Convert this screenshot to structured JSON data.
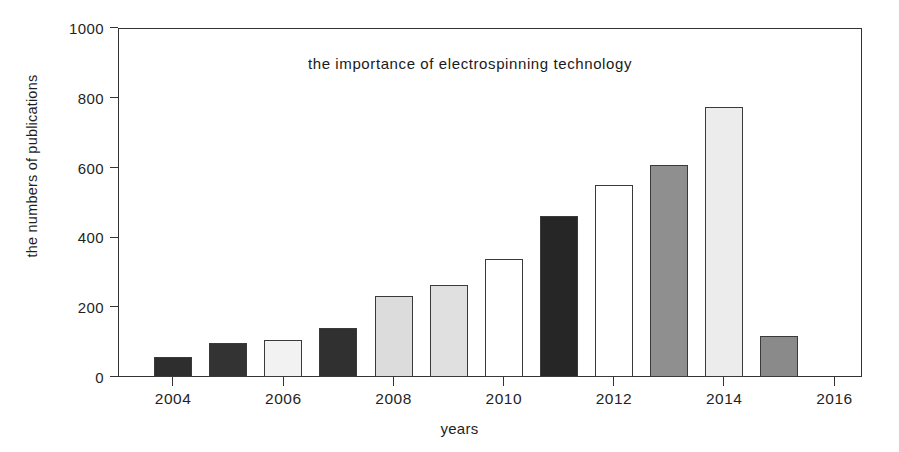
{
  "chart_data": {
    "type": "bar",
    "title": "the importance of electrospinning technology",
    "xlabel": "years",
    "ylabel": "the numbers of publications",
    "categories": [
      2004,
      2005,
      2006,
      2007,
      2008,
      2009,
      2010,
      2011,
      2012,
      2013,
      2014,
      2015
    ],
    "values": [
      58,
      98,
      105,
      140,
      232,
      265,
      337,
      462,
      550,
      608,
      775,
      118
    ],
    "bar_fills": [
      "#2e2e2e",
      "#333333",
      "#f2f2f2",
      "#303030",
      "#dcdcdc",
      "#e0e0e0",
      "#ffffff",
      "#262626",
      "#ffffff",
      "#8f8f8f",
      "#ececec",
      "#8a8a8a"
    ],
    "ylim": [
      0,
      1000
    ],
    "yticks": [
      0,
      200,
      400,
      600,
      800,
      1000
    ],
    "ytick_labels": [
      "0",
      "200",
      "400",
      "600",
      "800",
      "1000"
    ],
    "xlim": [
      2003,
      2016.5
    ],
    "xticks": [
      2004,
      2006,
      2008,
      2010,
      2012,
      2014,
      2016
    ],
    "xtick_labels": [
      "2004",
      "2006",
      "2008",
      "2010",
      "2012",
      "2014",
      "2016"
    ],
    "grid": false,
    "legend": null,
    "axis_color": "#333333",
    "bar_edge_color": "#3a3a3a"
  }
}
